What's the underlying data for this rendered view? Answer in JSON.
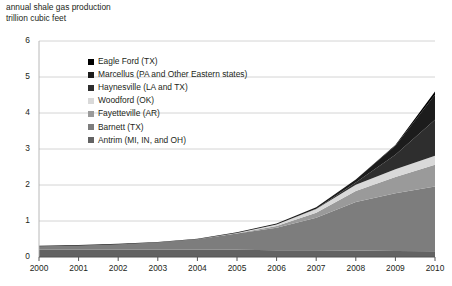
{
  "header": {
    "line1": "annual shale gas production",
    "line2": "trillion cubic feet"
  },
  "chart_data": {
    "type": "area",
    "stacked": true,
    "title": "annual shale gas production",
    "subtitle": "trillion cubic feet",
    "xlabel": "",
    "ylabel": "trillion cubic feet",
    "grid": true,
    "legend_position": "upper-left-inside",
    "xlim": [
      2000,
      2010
    ],
    "ylim": [
      0,
      6
    ],
    "yticks": [
      0,
      1,
      2,
      3,
      4,
      5,
      6
    ],
    "ytick_labels": [
      "0",
      "1",
      "2",
      "3",
      "4",
      "5",
      "6"
    ],
    "x": [
      2000,
      2001,
      2002,
      2003,
      2004,
      2005,
      2006,
      2007,
      2008,
      2009,
      2010
    ],
    "xtick_labels": [
      "2000",
      "2001",
      "2002",
      "2003",
      "2004",
      "2005",
      "2006",
      "2007",
      "2008",
      "2009",
      "2010"
    ],
    "stack_order_bottom_to_top": [
      "Antrim (MI, IN, and OH)",
      "Barnett (TX)",
      "Fayetteville (AR)",
      "Woodford (OK)",
      "Haynesville (LA and TX)",
      "Marcellus (PA and Other Eastern states)",
      "Eagle Ford (TX)"
    ],
    "series": [
      {
        "name": "Eagle Ford (TX)",
        "color": "#000000",
        "values": [
          0,
          0,
          0,
          0,
          0,
          0,
          0,
          0,
          0,
          0.02,
          0.09
        ]
      },
      {
        "name": "Marcellus (PA and Other Eastern states)",
        "color": "#1c1c1c",
        "values": [
          0.02,
          0.02,
          0.02,
          0.02,
          0.02,
          0.02,
          0.03,
          0.04,
          0.08,
          0.25,
          0.7
        ]
      },
      {
        "name": "Haynesville (LA and TX)",
        "color": "#2e2e2e",
        "values": [
          0,
          0,
          0,
          0,
          0,
          0,
          0,
          0.01,
          0.06,
          0.4,
          1.0
        ]
      },
      {
        "name": "Woodford (OK)",
        "color": "#d9d9d9",
        "values": [
          0,
          0,
          0,
          0,
          0,
          0.01,
          0.04,
          0.1,
          0.18,
          0.22,
          0.25
        ]
      },
      {
        "name": "Fayetteville (AR)",
        "color": "#9a9a9a",
        "values": [
          0,
          0,
          0,
          0,
          0,
          0.01,
          0.05,
          0.14,
          0.3,
          0.45,
          0.6
        ]
      },
      {
        "name": "Barnett (TX)",
        "color": "#7d7d7d",
        "values": [
          0.09,
          0.11,
          0.15,
          0.2,
          0.29,
          0.45,
          0.62,
          0.9,
          1.35,
          1.6,
          1.8
        ]
      },
      {
        "name": "Antrim (MI, IN, and OH)",
        "color": "#636363",
        "values": [
          0.2,
          0.2,
          0.2,
          0.2,
          0.2,
          0.2,
          0.19,
          0.19,
          0.18,
          0.17,
          0.16
        ]
      }
    ],
    "totals": [
      0.31,
      0.33,
      0.37,
      0.42,
      0.51,
      0.69,
      0.93,
      1.38,
      2.15,
      3.11,
      4.6
    ]
  },
  "legend": {
    "items": [
      {
        "label": "Eagle Ford (TX)",
        "color": "#000000"
      },
      {
        "label": "Marcellus (PA and Other Eastern states)",
        "color": "#1c1c1c"
      },
      {
        "label": "Haynesville (LA and TX)",
        "color": "#2e2e2e"
      },
      {
        "label": "Woodford (OK)",
        "color": "#d9d9d9"
      },
      {
        "label": "Fayetteville (AR)",
        "color": "#9a9a9a"
      },
      {
        "label": "Barnett (TX)",
        "color": "#7d7d7d"
      },
      {
        "label": "Antrim (MI, IN, and OH)",
        "color": "#636363"
      }
    ]
  }
}
